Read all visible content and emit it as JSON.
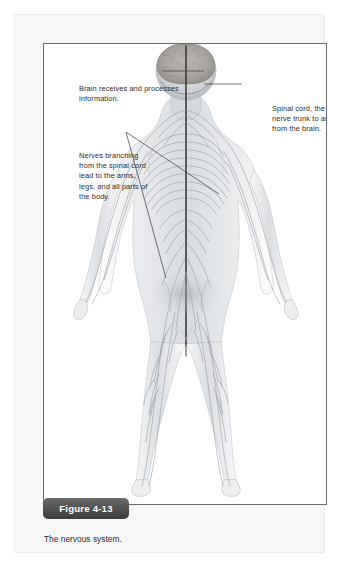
{
  "figure": {
    "badge_label": "Figure 4-13",
    "caption": "The nervous system.",
    "annotations": {
      "brain": "Brain receives and processes information.",
      "spinal_cord": "Spinal cord, the main nerve trunk to and from the brain.",
      "nerves": "Nerves branching from the spinal cord lead to the arms, legs, and all parts of the body."
    },
    "illustration": {
      "subject": "human-body-posterior-nervous-system",
      "style": "grayscale-anatomical-drawing"
    },
    "colors": {
      "page_background": "#ffffff",
      "panel_background": "#f7f7f7",
      "frame_border": "#6b6b6b",
      "badge_background": "#4a4a4a",
      "badge_text": "#ffffff",
      "body_text": "#2b2b2b",
      "leader_line": "#3a3a3a",
      "anatomy_line": "#8d9199"
    }
  }
}
